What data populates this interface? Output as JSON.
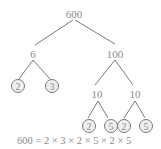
{
  "diagram": {
    "type": "factor-tree",
    "root": "600",
    "nodes": [
      {
        "id": "n600",
        "label": "600",
        "x": 74,
        "y": 15,
        "prime": false
      },
      {
        "id": "n6",
        "label": "6",
        "x": 33,
        "y": 56,
        "prime": false
      },
      {
        "id": "n100",
        "label": "100",
        "x": 113,
        "y": 56,
        "prime": false
      },
      {
        "id": "p2a",
        "label": "2",
        "x": 18,
        "y": 87,
        "prime": true
      },
      {
        "id": "p3",
        "label": "3",
        "x": 52,
        "y": 87,
        "prime": true
      },
      {
        "id": "n10a",
        "label": "10",
        "x": 93,
        "y": 97,
        "prime": false
      },
      {
        "id": "n10b",
        "label": "10",
        "x": 135,
        "y": 97,
        "prime": false
      },
      {
        "id": "p2b",
        "label": "2",
        "x": 90,
        "y": 127,
        "prime": true
      },
      {
        "id": "p5a",
        "label": "5",
        "x": 111,
        "y": 127,
        "prime": true
      },
      {
        "id": "p2c",
        "label": "2",
        "x": 124,
        "y": 127,
        "prime": true
      },
      {
        "id": "p5b",
        "label": "5",
        "x": 146,
        "y": 127,
        "prime": true
      }
    ],
    "edges": [
      [
        "n600",
        "n6"
      ],
      [
        "n600",
        "n100"
      ],
      [
        "n6",
        "p2a"
      ],
      [
        "n6",
        "p3"
      ],
      [
        "n100",
        "n10a"
      ],
      [
        "n100",
        "n10b"
      ],
      [
        "n10a",
        "p2b"
      ],
      [
        "n10a",
        "p5a"
      ],
      [
        "n10b",
        "p2c"
      ],
      [
        "n10b",
        "p5b"
      ]
    ],
    "equation": "600 = 2 × 3 × 2 × 5 × 2 × 5",
    "colors": {
      "line": "#7a7a7a",
      "text": "#8a8a8a"
    }
  }
}
